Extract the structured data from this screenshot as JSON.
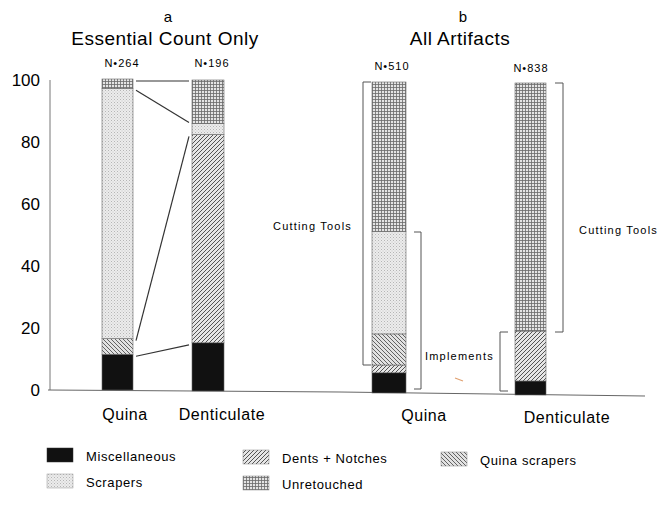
{
  "chart_data": [
    {
      "type": "bar",
      "stacked": true,
      "panel": "a",
      "title": "Essential Count Only",
      "categories": [
        "Quina",
        "Denticulate"
      ],
      "n_labels": [
        "N=264",
        "N=196"
      ],
      "ylim": [
        0,
        100
      ],
      "yticks": [
        0,
        20,
        40,
        60,
        80,
        100
      ],
      "series": [
        {
          "name": "Miscellaneous",
          "values": [
            11.5,
            15.5
          ]
        },
        {
          "name": "Dents + Notches",
          "values": [
            0,
            67
          ]
        },
        {
          "name": "Quina scrapers",
          "values": [
            5,
            0
          ]
        },
        {
          "name": "Scrapers",
          "values": [
            80.5,
            3.5
          ]
        },
        {
          "name": "Unretouched",
          "values": [
            3,
            14
          ]
        }
      ],
      "connector_lines": true
    },
    {
      "type": "bar",
      "stacked": true,
      "panel": "b",
      "title": "All Artifacts",
      "categories": [
        "Quina",
        "Denticulate"
      ],
      "n_labels": [
        "N=510",
        "N=838"
      ],
      "ylim": [
        0,
        100
      ],
      "series": [
        {
          "name": "Miscellaneous",
          "values": [
            6.5,
            4.5
          ]
        },
        {
          "name": "Dents + Notches",
          "values": [
            2.5,
            16
          ]
        },
        {
          "name": "Quina scrapers",
          "values": [
            10,
            0
          ]
        },
        {
          "name": "Scrapers",
          "values": [
            33,
            0
          ]
        },
        {
          "name": "Unretouched",
          "values": [
            48,
            79.5
          ]
        }
      ],
      "annotations": [
        {
          "text": "Cutting Tools",
          "bar": "Quina",
          "range": [
            18,
            100
          ]
        },
        {
          "text": "Cutting Tools",
          "bar": "Denticulate",
          "range": [
            20,
            100
          ]
        },
        {
          "text": "Implements",
          "bar": "Quina",
          "range": [
            0,
            51
          ]
        },
        {
          "text": "Implements",
          "bar": "Denticulate",
          "range": [
            0,
            20
          ]
        }
      ]
    }
  ],
  "panels": {
    "a": {
      "letter": "a",
      "title": "Essential Count Only"
    },
    "b": {
      "letter": "b",
      "title": "All Artifacts"
    }
  },
  "labels": {
    "n_a_quina": "N•264",
    "n_a_dent": "N•196",
    "n_b_quina": "N•510",
    "n_b_dent": "N•838",
    "cat_a_quina": "Quina",
    "cat_a_dent": "Denticulate",
    "cat_b_quina": "Quina",
    "cat_b_dent": "Denticulate",
    "cutting_tools_left": "Cutting Tools",
    "cutting_tools_right": "Cutting Tools",
    "implements": "Implements"
  },
  "yticks": [
    "0",
    "20",
    "40",
    "60",
    "80",
    "100"
  ],
  "legend": [
    {
      "key": "Miscellaneous",
      "label": "Miscellaneous"
    },
    {
      "key": "Dents + Notches",
      "label": "Dents + Notches"
    },
    {
      "key": "Quina scrapers",
      "label": "Quina scrapers"
    },
    {
      "key": "Scrapers",
      "label": "Scrapers"
    },
    {
      "key": "Unretouched",
      "label": "Unretouched"
    }
  ]
}
